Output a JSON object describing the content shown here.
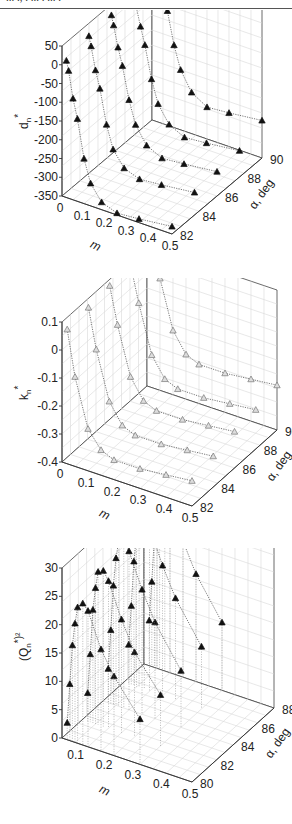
{
  "header": {
    "cut_text": "... ., . ... . ... ."
  },
  "panels": [
    {
      "label": "(a)",
      "z_label": "d",
      "z_sub": "n",
      "z_sup": "*",
      "x_label": "m",
      "y_label": "α, deg",
      "z_ticks": [
        "50",
        "0",
        "-50",
        "-100",
        "-150",
        "-200",
        "-250",
        "-300",
        "-350"
      ],
      "x_ticks": [
        "0",
        "0.1",
        "0.2",
        "0.3",
        "0.4",
        "0.5"
      ],
      "y_ticks": [
        "82",
        "84",
        "86",
        "88",
        "90"
      ]
    },
    {
      "label": "(b)",
      "z_label": "k",
      "z_sub": "n",
      "z_sup": "*",
      "x_label": "m",
      "y_label": "α, deg",
      "z_ticks": [
        "0.1",
        "0",
        "-0.1",
        "-0.2",
        "-0.3",
        "-0.4"
      ],
      "x_ticks": [
        "0",
        "0.1",
        "0.2",
        "0.3",
        "0.4",
        "0.5"
      ],
      "y_ticks": [
        "82",
        "84",
        "86",
        "88",
        "90"
      ]
    },
    {
      "label": "(c)",
      "z_label": "(Q",
      "z_sub": "n",
      "z_sup": "*)²",
      "x_label": "m",
      "y_label": "α, deg",
      "z_ticks": [
        "30",
        "25",
        "20",
        "15",
        "10",
        "5",
        "0"
      ],
      "x_ticks": [
        "0.1",
        "0.2",
        "0.3",
        "0.4",
        "0.5"
      ],
      "y_ticks": [
        "80",
        "82",
        "84",
        "86",
        "88"
      ]
    }
  ],
  "chart_data": [
    {
      "type": "scatter",
      "title": "(a)",
      "xlabel": "m",
      "ylabel": "α, deg",
      "zlabel": "d_n*",
      "xlim": [
        0,
        0.5
      ],
      "ylim": [
        82,
        90
      ],
      "zlim": [
        -350,
        50
      ],
      "grid": true,
      "marker": "filled-triangle",
      "series": [
        {
          "name": "α=82",
          "m": [
            0.02,
            0.03,
            0.05,
            0.07,
            0.1,
            0.13,
            0.18,
            0.25,
            0.35,
            0.5
          ],
          "values": [
            15,
            -10,
            -80,
            -130,
            -230,
            -290,
            -330,
            -345,
            -340,
            -330
          ]
        },
        {
          "name": "α=84",
          "m": [
            0.02,
            0.03,
            0.05,
            0.07,
            0.1,
            0.13,
            0.18,
            0.25,
            0.35,
            0.5
          ],
          "values": [
            30,
            5,
            -55,
            -100,
            -190,
            -250,
            -290,
            -305,
            -300,
            -290
          ]
        },
        {
          "name": "α=86",
          "m": [
            0.02,
            0.03,
            0.05,
            0.07,
            0.1,
            0.13,
            0.18,
            0.25,
            0.35,
            0.5
          ],
          "values": [
            35,
            10,
            -45,
            -90,
            -175,
            -235,
            -280,
            -300,
            -295,
            -285
          ]
        },
        {
          "name": "α=88",
          "m": [
            0.02,
            0.03,
            0.05,
            0.07,
            0.1,
            0.13,
            0.18,
            0.25,
            0.35,
            0.5
          ],
          "values": [
            35,
            10,
            -40,
            -85,
            -170,
            -230,
            -275,
            -295,
            -290,
            -280
          ]
        },
        {
          "name": "α=90",
          "m": [
            0.02,
            0.03,
            0.05,
            0.07,
            0.1,
            0.13,
            0.18,
            0.25,
            0.35,
            0.5
          ],
          "values": [
            45,
            35,
            0,
            -45,
            -130,
            -190,
            -240,
            -265,
            -260,
            -250
          ]
        }
      ]
    },
    {
      "type": "scatter",
      "title": "(b)",
      "xlabel": "m",
      "ylabel": "α, deg",
      "zlabel": "k_n*",
      "xlim": [
        0,
        0.5
      ],
      "ylim": [
        82,
        90
      ],
      "zlim": [
        -0.4,
        0.1
      ],
      "grid": true,
      "marker": "open-triangle",
      "series": [
        {
          "name": "α=82",
          "m": [
            0.02,
            0.05,
            0.1,
            0.15,
            0.2,
            0.3,
            0.4,
            0.5
          ],
          "values": [
            0.08,
            -0.08,
            -0.25,
            -0.31,
            -0.33,
            -0.33,
            -0.32,
            -0.31
          ]
        },
        {
          "name": "α=84",
          "m": [
            0.02,
            0.05,
            0.1,
            0.15,
            0.2,
            0.3,
            0.4,
            0.5
          ],
          "values": [
            0.09,
            -0.05,
            -0.22,
            -0.29,
            -0.31,
            -0.31,
            -0.3,
            -0.29
          ]
        },
        {
          "name": "α=86",
          "m": [
            0.02,
            0.05,
            0.1,
            0.15,
            0.2,
            0.3,
            0.4,
            0.5
          ],
          "values": [
            0.1,
            -0.03,
            -0.2,
            -0.27,
            -0.29,
            -0.29,
            -0.28,
            -0.27
          ]
        },
        {
          "name": "α=88",
          "m": [
            0.02,
            0.05,
            0.1,
            0.15,
            0.2,
            0.3,
            0.4,
            0.5
          ],
          "values": [
            0.1,
            -0.02,
            -0.19,
            -0.26,
            -0.28,
            -0.28,
            -0.27,
            -0.26
          ]
        },
        {
          "name": "α=90",
          "m": [
            0.02,
            0.05,
            0.1,
            0.15,
            0.2,
            0.3,
            0.4,
            0.5
          ],
          "values": [
            0.11,
            0.0,
            -0.17,
            -0.24,
            -0.26,
            -0.26,
            -0.25,
            -0.24
          ]
        }
      ]
    },
    {
      "type": "scatter",
      "title": "(c)",
      "xlabel": "m",
      "ylabel": "α, deg",
      "zlabel": "(Q_n*)^2",
      "xlim": [
        0,
        0.5
      ],
      "ylim": [
        80,
        88
      ],
      "zlim": [
        0,
        30
      ],
      "grid": true,
      "marker": "filled-triangle",
      "series": [
        {
          "name": "α=80",
          "m": [
            0.02,
            0.03,
            0.04,
            0.05,
            0.06,
            0.08,
            0.1,
            0.15,
            0.2,
            0.3
          ],
          "values": [
            3,
            10,
            17,
            21,
            24,
            25,
            24,
            18,
            14,
            8
          ]
        },
        {
          "name": "α=82",
          "m": [
            0.02,
            0.03,
            0.04,
            0.05,
            0.06,
            0.08,
            0.1,
            0.15,
            0.2,
            0.3
          ],
          "values": [
            5,
            12,
            20,
            24,
            27,
            27.5,
            26,
            20,
            15,
            9
          ]
        },
        {
          "name": "α=84",
          "m": [
            0.02,
            0.03,
            0.04,
            0.05,
            0.06,
            0.08,
            0.1,
            0.15,
            0.2,
            0.3
          ],
          "values": [
            6,
            13,
            21,
            26,
            29,
            29.5,
            28,
            22,
            17,
            10
          ]
        },
        {
          "name": "α=86",
          "m": [
            0.02,
            0.03,
            0.04,
            0.05,
            0.06,
            0.08,
            0.1,
            0.15,
            0.2,
            0.3
          ],
          "values": [
            7,
            14,
            22,
            27,
            30,
            30,
            29,
            23,
            18,
            11
          ]
        },
        {
          "name": "α=88",
          "m": [
            0.02,
            0.03,
            0.04,
            0.05,
            0.06,
            0.08,
            0.1,
            0.15,
            0.2,
            0.3
          ],
          "values": [
            8,
            15,
            23,
            27.5,
            30,
            30.5,
            29.5,
            24,
            19,
            12
          ]
        }
      ]
    }
  ]
}
